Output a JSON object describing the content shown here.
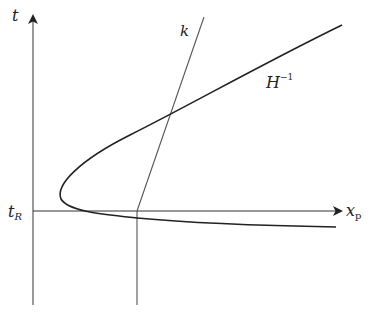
{
  "diagram": {
    "labels": {
      "t_axis": "t",
      "k_line": "k",
      "curve_main": "H",
      "curve_sup": "−1",
      "tR_main": "t",
      "tR_sub": "R",
      "xp_main": "x",
      "xp_sub": "p"
    },
    "colors": {
      "axis": "#555555",
      "curve": "#222222",
      "line": "#555555"
    }
  }
}
